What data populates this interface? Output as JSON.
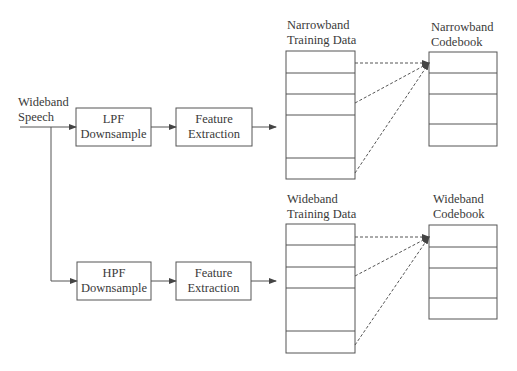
{
  "input": {
    "line1": "Wideband",
    "line2": "Speech"
  },
  "top_branch": {
    "filter": {
      "line1": "LPF",
      "line2": "Downsample"
    },
    "feature": {
      "line1": "Feature",
      "line2": "Extraction"
    },
    "training_data": {
      "line1": "Narrowband",
      "line2": "Training Data"
    },
    "codebook": {
      "line1": "Narrowband",
      "line2": "Codebook"
    }
  },
  "bottom_branch": {
    "filter": {
      "line1": "HPF",
      "line2": "Downsample"
    },
    "feature": {
      "line1": "Feature",
      "line2": "Extraction"
    },
    "training_data": {
      "line1": "Wideband",
      "line2": "Training Data"
    },
    "codebook": {
      "line1": "Wideband",
      "line2": "Codebook"
    }
  },
  "colors": {
    "stroke": "#555555",
    "text": "#3a3a3a",
    "background": "#ffffff"
  }
}
